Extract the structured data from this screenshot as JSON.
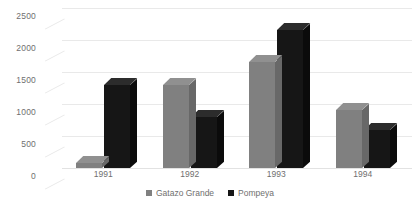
{
  "chart_data": {
    "type": "bar",
    "title": "",
    "subtitle": "",
    "xlabel": "",
    "ylabel": "",
    "categories": [
      "1991",
      "1992",
      "1993",
      "1994"
    ],
    "series": [
      {
        "name": "Gatazo Grande",
        "color": "#808080",
        "values": [
          80,
          1300,
          1650,
          900
        ]
      },
      {
        "name": "Pompeya",
        "color": "#161616",
        "values": [
          1300,
          800,
          2150,
          600
        ]
      }
    ],
    "yticks": [
      0,
      500,
      1000,
      1500,
      2000,
      2500
    ],
    "ytick_labels": [
      "0",
      "500",
      "1000",
      "1500",
      "2000",
      "2500"
    ],
    "ylim": [
      0,
      2500
    ],
    "grid": true,
    "legend_position": "bottom",
    "three_d": true
  },
  "legend": {
    "items": [
      {
        "label": "Gatazo Grande",
        "color": "#808080"
      },
      {
        "label": "Pompeya",
        "color": "#161616"
      }
    ]
  },
  "colors": {
    "background": "#ffffff",
    "gridline": "#e9e9e9",
    "tick_text": "#6f6f6f",
    "series_gatazo_grande": "#808080",
    "series_pompeya": "#161616"
  }
}
